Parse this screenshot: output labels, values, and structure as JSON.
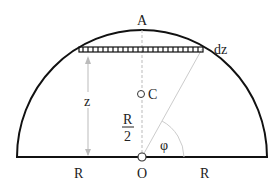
{
  "diagram": {
    "type": "semicircle-centroid",
    "labels": {
      "apex": "A",
      "strip": "dz",
      "height": "z",
      "centroid": "C",
      "half_r_num": "R",
      "half_r_den": "2",
      "angle": "φ",
      "origin": "O",
      "left_radius": "R",
      "right_radius": "R"
    },
    "colors": {
      "outline": "#111111",
      "guide": "#bbbbbb",
      "text": "#222222"
    }
  }
}
